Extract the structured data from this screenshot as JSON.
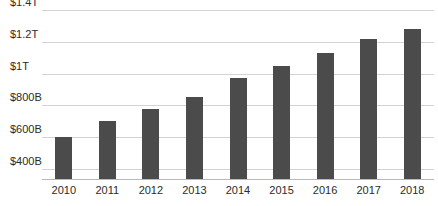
{
  "chart_data": {
    "type": "bar",
    "title": "",
    "subtitle": "",
    "xlabel": "",
    "ylabel": "",
    "categories": [
      "2010",
      "2011",
      "2012",
      "2013",
      "2014",
      "2015",
      "2016",
      "2017",
      "2018"
    ],
    "values": [
      600,
      700,
      780,
      850,
      975,
      1050,
      1130,
      1220,
      1280
    ],
    "value_unit": "billions of USD",
    "ylim": [
      330,
      1400
    ],
    "ytick_values": [
      400,
      600,
      800,
      1000,
      1200,
      1400
    ],
    "ytick_labels": [
      "$400B",
      "$600B",
      "$800B",
      "$1T",
      "$1.2T",
      "$1.4T"
    ],
    "grid": true,
    "legend": false,
    "legend_position": "none",
    "bar_color": "#4b4b4b",
    "gridline_color": "#d3d3d3",
    "axis_color": "#b9b9b9",
    "background_color": "#ffffff",
    "text_color": "#2b2b2b"
  }
}
